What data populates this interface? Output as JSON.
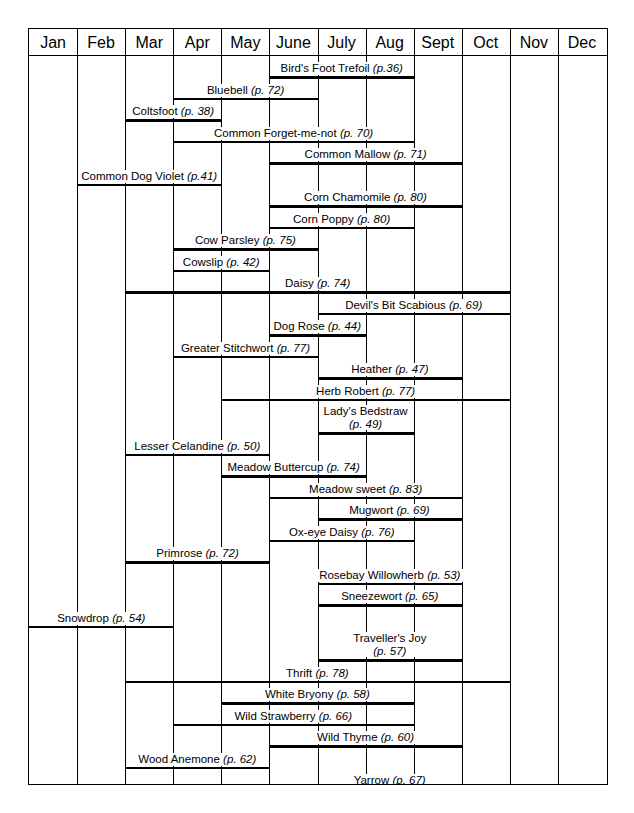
{
  "chart_data": {
    "type": "bar",
    "orientation": "horizontal",
    "title": "",
    "subtitle": "",
    "xlabel": "",
    "ylabel": "",
    "grid": true,
    "legend_position": "none",
    "categories": [
      "Jan",
      "Feb",
      "Mar",
      "Apr",
      "May",
      "June",
      "July",
      "Aug",
      "Sept",
      "Oct",
      "Nov",
      "Dec"
    ],
    "x_tick_labels": [
      "Jan",
      "Feb",
      "Mar",
      "Apr",
      "May",
      "June",
      "July",
      "Aug",
      "Sept",
      "Oct",
      "Nov",
      "Dec"
    ],
    "xlim": [
      0,
      12
    ],
    "bars": [
      {
        "name": "Bird's Foot Trefoil",
        "page": "(p.36)",
        "start": 5,
        "end": 8,
        "start_month": "June",
        "end_month": "Aug"
      },
      {
        "name": "Bluebell",
        "page": "(p. 72)",
        "start": 3,
        "end": 6,
        "start_month": "Apr",
        "end_month": "July"
      },
      {
        "name": "Coltsfoot",
        "page": "(p. 38)",
        "start": 2,
        "end": 4,
        "start_month": "Mar",
        "end_month": "May"
      },
      {
        "name": "Common Forget-me-not",
        "page": "(p. 70)",
        "start": 3,
        "end": 8,
        "start_month": "Apr",
        "end_month": "Aug"
      },
      {
        "name": "Common Mallow",
        "page": "(p. 71)",
        "start": 5,
        "end": 9,
        "start_month": "June",
        "end_month": "Sept"
      },
      {
        "name": "Common Dog Violet",
        "page": "(p.41)",
        "start": 1,
        "end": 4,
        "start_month": "Feb",
        "end_month": "May"
      },
      {
        "name": "Corn Chamomile",
        "page": "(p. 80)",
        "start": 5,
        "end": 9,
        "start_month": "June",
        "end_month": "Sept"
      },
      {
        "name": "Corn Poppy",
        "page": "(p. 80)",
        "start": 5,
        "end": 8,
        "start_month": "June",
        "end_month": "Aug"
      },
      {
        "name": "Cow Parsley",
        "page": "(p. 75)",
        "start": 3,
        "end": 6,
        "start_month": "Apr",
        "end_month": "July"
      },
      {
        "name": "Cowslip",
        "page": "(p. 42)",
        "start": 3,
        "end": 5,
        "start_month": "Apr",
        "end_month": "June"
      },
      {
        "name": "Daisy",
        "page": "(p. 74)",
        "start": 2,
        "end": 10,
        "start_month": "Mar",
        "end_month": "Oct"
      },
      {
        "name": "Devil's Bit Scabious",
        "page": "(p. 69)",
        "start": 6,
        "end": 10,
        "start_month": "July",
        "end_month": "Oct"
      },
      {
        "name": "Dog Rose",
        "page": "(p. 44)",
        "start": 5,
        "end": 7,
        "start_month": "June",
        "end_month": "July"
      },
      {
        "name": "Greater Stitchwort",
        "page": "(p. 77)",
        "start": 3,
        "end": 6,
        "start_month": "Apr",
        "end_month": "July"
      },
      {
        "name": "Heather",
        "page": "(p. 47)",
        "start": 6,
        "end": 9,
        "start_month": "July",
        "end_month": "Sept"
      },
      {
        "name": "Herb Robert",
        "page": "(p. 77)",
        "start": 4,
        "end": 10,
        "start_month": "May",
        "end_month": "Oct"
      },
      {
        "name": "Lady's Bedstraw",
        "page": "(p. 49)",
        "start": 6,
        "end": 8,
        "start_month": "July",
        "end_month": "Aug",
        "two_line": true
      },
      {
        "name": "Lesser Celandine",
        "page": "(p. 50)",
        "start": 2,
        "end": 5,
        "start_month": "Mar",
        "end_month": "June"
      },
      {
        "name": "Meadow Buttercup",
        "page": "(p. 74)",
        "start": 4,
        "end": 7,
        "start_month": "May",
        "end_month": "July"
      },
      {
        "name": "Meadow sweet",
        "page": "(p. 83)",
        "start": 5,
        "end": 9,
        "start_month": "June",
        "end_month": "Sept"
      },
      {
        "name": "Mugwort",
        "page": "(p. 69)",
        "start": 6,
        "end": 9,
        "start_month": "July",
        "end_month": "Sept"
      },
      {
        "name": "Ox-eye Daisy",
        "page": "(p. 76)",
        "start": 5,
        "end": 8,
        "start_month": "June",
        "end_month": "Aug"
      },
      {
        "name": "Primrose",
        "page": "(p. 72)",
        "start": 2,
        "end": 5,
        "start_month": "Mar",
        "end_month": "June"
      },
      {
        "name": "Rosebay Willowherb",
        "page": "(p. 53)",
        "start": 6,
        "end": 9,
        "start_month": "July",
        "end_month": "Sept"
      },
      {
        "name": "Sneezewort",
        "page": "(p. 65)",
        "start": 6,
        "end": 9,
        "start_month": "July",
        "end_month": "Sept"
      },
      {
        "name": "Snowdrop",
        "page": "(p. 54)",
        "start": 0,
        "end": 3,
        "start_month": "Jan",
        "end_month": "Apr"
      },
      {
        "name": "Traveller's Joy",
        "page": "(p. 57)",
        "start": 6,
        "end": 9,
        "start_month": "July",
        "end_month": "Sept",
        "two_line": true
      },
      {
        "name": "Thrift",
        "page": "(p. 78)",
        "start": 2,
        "end": 10,
        "start_month": "Mar",
        "end_month": "Oct"
      },
      {
        "name": "White Bryony",
        "page": "(p. 58)",
        "start": 4,
        "end": 8,
        "start_month": "May",
        "end_month": "Aug"
      },
      {
        "name": "Wild Strawberry",
        "page": "(p. 66)",
        "start": 3,
        "end": 8,
        "start_month": "Apr",
        "end_month": "Aug"
      },
      {
        "name": "Wild Thyme",
        "page": "(p. 60)",
        "start": 5,
        "end": 9,
        "start_month": "June",
        "end_month": "Sept"
      },
      {
        "name": "Wood Anemone",
        "page": "(p. 62)",
        "start": 2,
        "end": 5,
        "start_month": "Mar",
        "end_month": "June"
      },
      {
        "name": "Yarrow",
        "page": "(p. 67)",
        "start": 5,
        "end": 10,
        "start_month": "June",
        "end_month": "Oct"
      }
    ]
  },
  "colors": {
    "ink": "#000000",
    "paper": "#ffffff"
  }
}
